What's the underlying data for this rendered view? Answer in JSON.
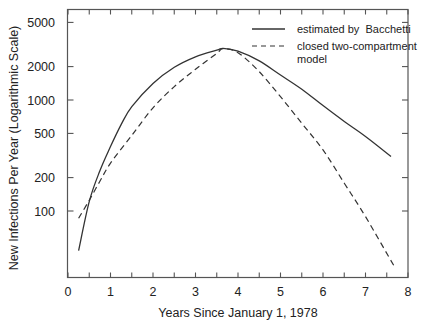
{
  "chart_data": {
    "type": "line",
    "title": "",
    "xlabel": "Years Since January 1, 1978",
    "ylabel": "New Infections Per Year (Logarithmic Scale)",
    "xlim": [
      0,
      8
    ],
    "ylim": [
      20,
      6000
    ],
    "yscale": "log",
    "grid": false,
    "legend_position": "upper right",
    "x_ticks": [
      0,
      1,
      2,
      3,
      4,
      5,
      6,
      7,
      8
    ],
    "x_tick_labels": [
      "0",
      "1",
      "2",
      "3",
      "4",
      "5",
      "6",
      "7",
      "8"
    ],
    "x_minor_ticks": [
      0.5,
      1.5,
      2.5,
      3.5,
      4.5,
      5.5,
      6.5,
      7.5
    ],
    "y_ticks": [
      100,
      200,
      500,
      1000,
      2000,
      5000
    ],
    "y_tick_labels": [
      "100",
      "200",
      "500",
      "1000",
      "2000",
      "5000"
    ],
    "series": [
      {
        "name": "estimated by  Bacchetti",
        "style": "solid",
        "x": [
          0.25,
          0.5,
          0.75,
          1.0,
          1.25,
          1.5,
          2.0,
          2.5,
          3.0,
          3.5,
          3.65,
          4.0,
          4.5,
          5.0,
          5.5,
          6.0,
          6.5,
          7.0,
          7.6
        ],
        "values": [
          44,
          122,
          230,
          380,
          600,
          870,
          1410,
          1970,
          2450,
          2810,
          2920,
          2750,
          2250,
          1680,
          1250,
          890,
          640,
          470,
          310
        ]
      },
      {
        "name": "closed two-compartment model",
        "style": "dashed",
        "x": [
          0.25,
          0.5,
          0.75,
          1.0,
          1.5,
          2.0,
          2.5,
          3.0,
          3.5,
          3.65,
          4.0,
          4.5,
          5.0,
          5.5,
          6.0,
          6.5,
          7.0,
          7.67
        ],
        "values": [
          86,
          125,
          185,
          270,
          480,
          850,
          1320,
          1890,
          2630,
          2900,
          2670,
          1800,
          1070,
          617,
          355,
          178,
          89,
          32
        ]
      }
    ]
  }
}
